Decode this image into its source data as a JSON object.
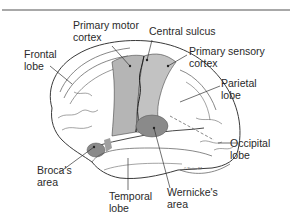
{
  "figure": {
    "type": "labeled anatomical diagram",
    "colors": {
      "motor_sensory_fill": "#b5b5b5",
      "language_area_fill": "#8a8a8a",
      "outline": "#3a3a3a",
      "rule": "#a8a8a8"
    }
  },
  "labels": {
    "primary_motor": [
      "Primary motor",
      "cortex"
    ],
    "central_sulcus": "Central sulcus",
    "primary_sensory": [
      "Primary sensory",
      "cortex"
    ],
    "frontal": [
      "Frontal",
      "lobe"
    ],
    "parietal": [
      "Parietal",
      "lobe"
    ],
    "occipital": [
      "Occipital",
      "lobe"
    ],
    "broca": [
      "Broca's",
      "area"
    ],
    "temporal": [
      "Temporal",
      "lobe"
    ],
    "wernicke": [
      "Wernicke's",
      "area"
    ]
  },
  "signature": "© Netter 97"
}
